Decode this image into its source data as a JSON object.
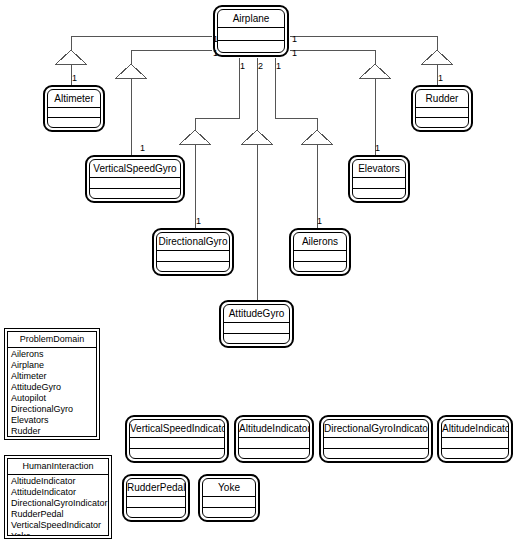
{
  "diagram": {
    "type": "uml-class-diagram",
    "stroke_color": "#000000",
    "background_color": "#ffffff"
  },
  "classes": [
    {
      "id": "airplane",
      "name": "Airplane",
      "x": 213,
      "y": 5,
      "w": 76,
      "h": 52
    },
    {
      "id": "altimeter",
      "name": "Altimeter",
      "x": 43,
      "y": 85,
      "w": 62,
      "h": 47
    },
    {
      "id": "vertical_speed_gyro",
      "name": "VerticalSpeedGyro",
      "x": 85,
      "y": 155,
      "w": 100,
      "h": 48
    },
    {
      "id": "directional_gyro",
      "name": "DirectionalGyro",
      "x": 152,
      "y": 228,
      "w": 82,
      "h": 48
    },
    {
      "id": "attitude_gyro",
      "name": "AttitudeGyro",
      "x": 219,
      "y": 300,
      "w": 75,
      "h": 48
    },
    {
      "id": "ailerons",
      "name": "Ailerons",
      "x": 289,
      "y": 228,
      "w": 62,
      "h": 48
    },
    {
      "id": "elevators",
      "name": "Elevators",
      "x": 348,
      "y": 155,
      "w": 62,
      "h": 48
    },
    {
      "id": "rudder",
      "name": "Rudder",
      "x": 411,
      "y": 85,
      "w": 62,
      "h": 47
    },
    {
      "id": "vertical_speed_ind",
      "name": "VerticalSpeedIndicator",
      "x": 125,
      "y": 415,
      "w": 104,
      "h": 48
    },
    {
      "id": "altitude_ind_1",
      "name": "AltitudeIndicator",
      "x": 234,
      "y": 415,
      "w": 80,
      "h": 48
    },
    {
      "id": "directional_gyro_ind",
      "name": "DirectionalGyroIndicator",
      "x": 319,
      "y": 415,
      "w": 114,
      "h": 48
    },
    {
      "id": "altitude_ind_2",
      "name": "AltitudeIndicator",
      "x": 437,
      "y": 415,
      "w": 76,
      "h": 48
    },
    {
      "id": "rudder_pedal",
      "name": "RudderPedal",
      "x": 122,
      "y": 474,
      "w": 68,
      "h": 48
    },
    {
      "id": "yoke",
      "name": "Yoke",
      "x": 198,
      "y": 474,
      "w": 62,
      "h": 48
    }
  ],
  "packages": [
    {
      "id": "problem_domain",
      "name": "ProblemDomain",
      "x": 4,
      "y": 328,
      "w": 96,
      "h": 112,
      "items": [
        "Ailerons",
        "Airplane",
        "Altimeter",
        "AttitudeGyro",
        "Autopilot",
        "DirectionalGyro",
        "Elevators",
        "Rudder",
        "VerticalSpeedGyro"
      ]
    },
    {
      "id": "human_interaction",
      "name": "HumanInteraction",
      "x": 4,
      "y": 455,
      "w": 108,
      "h": 84,
      "items": [
        "AltitudeIndicator",
        "AttitudeIndicator",
        "DirectionalGyroIndicator",
        "RudderPedal",
        "VerticalSpeedIndicator",
        "Yoke"
      ]
    }
  ],
  "multiplicities": [
    {
      "id": "m-alt-top",
      "label": "1",
      "x": 213,
      "y": 35
    },
    {
      "id": "m-vsg-top",
      "label": "1",
      "x": 213,
      "y": 49
    },
    {
      "id": "m-rud-top",
      "label": "1",
      "x": 292,
      "y": 35
    },
    {
      "id": "m-ele-top",
      "label": "1",
      "x": 292,
      "y": 49
    },
    {
      "id": "m-dg-bot",
      "label": "1",
      "x": 240,
      "y": 62
    },
    {
      "id": "m-ag-bot",
      "label": "2",
      "x": 258,
      "y": 62
    },
    {
      "id": "m-ail-bot",
      "label": "1",
      "x": 276,
      "y": 62
    },
    {
      "id": "m-altimeter",
      "label": "1",
      "x": 72,
      "y": 74
    },
    {
      "id": "m-vsgyro",
      "label": "1",
      "x": 140,
      "y": 144
    },
    {
      "id": "m-dirgyro",
      "label": "1",
      "x": 196,
      "y": 217
    },
    {
      "id": "m-ailerons",
      "label": "1",
      "x": 317,
      "y": 217
    },
    {
      "id": "m-elevators",
      "label": "1",
      "x": 375,
      "y": 144
    },
    {
      "id": "m-rudder",
      "label": "1",
      "x": 438,
      "y": 74
    }
  ],
  "connections": [
    {
      "id": "conn-altimeter",
      "from": "airplane",
      "to": "altimeter",
      "relation": "generalization"
    },
    {
      "id": "conn-vsgyro",
      "from": "airplane",
      "to": "vertical_speed_gyro",
      "relation": "generalization"
    },
    {
      "id": "conn-dirgyro",
      "from": "airplane",
      "to": "directional_gyro",
      "relation": "generalization"
    },
    {
      "id": "conn-attgyro",
      "from": "airplane",
      "to": "attitude_gyro",
      "relation": "generalization"
    },
    {
      "id": "conn-ailerons",
      "from": "airplane",
      "to": "ailerons",
      "relation": "generalization"
    },
    {
      "id": "conn-elevators",
      "from": "airplane",
      "to": "elevators",
      "relation": "generalization"
    },
    {
      "id": "conn-rudder",
      "from": "airplane",
      "to": "rudder",
      "relation": "generalization"
    }
  ]
}
